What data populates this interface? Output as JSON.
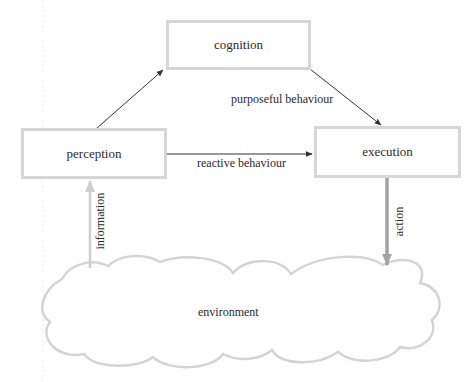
{
  "diagram": {
    "nodes": {
      "cognition": "cognition",
      "perception": "perception",
      "execution": "execution",
      "environment": "environment"
    },
    "edges": {
      "perception_to_cognition": {
        "from": "perception",
        "to": "cognition",
        "label": ""
      },
      "cognition_to_execution": {
        "from": "cognition",
        "to": "execution",
        "label": "purposeful behaviour"
      },
      "perception_to_execution": {
        "from": "perception",
        "to": "execution",
        "label": "reactive behaviour"
      },
      "environment_to_perception": {
        "from": "environment",
        "to": "perception",
        "label": "information"
      },
      "execution_to_environment": {
        "from": "execution",
        "to": "environment",
        "label": "action"
      }
    },
    "colors": {
      "box_border": "#d6d6d6",
      "black_arrow": "#333333",
      "information_arrow": "#cfcfcf",
      "action_arrow": "#a3a3a3",
      "cloud_stroke": "#d4d4d4",
      "text": "#2a2a2a"
    }
  }
}
